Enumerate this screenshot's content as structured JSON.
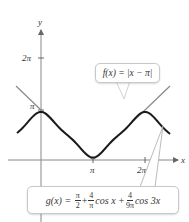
{
  "chart_data": {
    "type": "line",
    "title": "",
    "xlabel": "x",
    "ylabel": "y",
    "x_ticks": [
      "π",
      "2π"
    ],
    "y_ticks": [
      "π",
      "2π"
    ],
    "xlim": [
      -0.75,
      4.3
    ],
    "ylim": [
      0,
      7.2
    ],
    "series": [
      {
        "name": "f(x) = |x − π|",
        "style": "thin gray line",
        "points": [
          [
            -1.45,
            4.6
          ],
          [
            0,
            3.1416
          ],
          [
            3.1416,
            0
          ],
          [
            6.2832,
            3.1416
          ],
          [
            7.2,
            4.06
          ]
        ]
      },
      {
        "name": "g(x) = π/2 + 4/π cos x + 4/(9π) cos 3x",
        "style": "thick black curve",
        "x_range": [
          -1.45,
          7.6
        ],
        "sample_points": [
          [
            0,
            3.0
          ],
          [
            1.5708,
            1.5708
          ],
          [
            3.1416,
            0.14
          ],
          [
            4.7124,
            1.5708
          ],
          [
            6.2832,
            3.0
          ]
        ]
      }
    ],
    "annotations": [
      "f(x) = |x − π|",
      "g(x) = π/2 + 4/π cos x + 4/(9π) cos 3x"
    ]
  },
  "axes": {
    "x_label": "x",
    "y_label": "y",
    "x_tick_pi": "π",
    "x_tick_2pi": "2π",
    "y_tick_pi": "π",
    "y_tick_2pi": "2π"
  },
  "callouts": {
    "f": "f(x) = |x − π|",
    "g": {
      "lhs": "g(x) =",
      "t1_num": "π",
      "t1_den": "2",
      "plus1": "+",
      "t2_num": "4",
      "t2_den": "π",
      "t2_fn": "cos x +",
      "t3_num": "4",
      "t3_den": "9π",
      "t3_fn": "cos 3x"
    }
  },
  "colors": {
    "f_line": "#8a8a8a",
    "g_curve": "#1a1a1a",
    "axis": "#777777"
  }
}
